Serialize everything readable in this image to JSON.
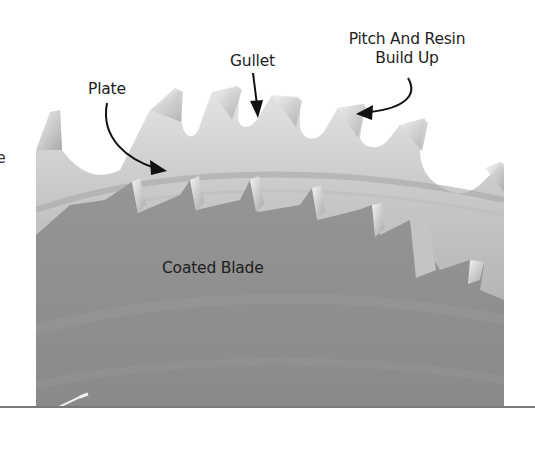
{
  "figure": {
    "labels": {
      "plate": "Plate",
      "gullet": "Gullet",
      "pitch_line1": "Pitch And Resin",
      "pitch_line2": "Build Up",
      "coated_blade": "Coated Blade"
    },
    "cut_off_text": "e",
    "colors": {
      "background": "#ffffff",
      "coated_area": "#8f8f8f",
      "plate_steel": "#cfcfcf",
      "tooth_tip": "#e8e8e8",
      "label_text": "#1e1e1e",
      "arrow": "#111111",
      "rule": "#7a7a7a"
    }
  }
}
